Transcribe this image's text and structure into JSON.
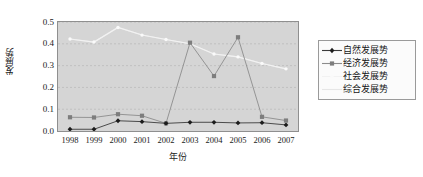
{
  "chart_data": {
    "type": "line",
    "title": "",
    "xlabel": "年份",
    "ylabel": "发展势",
    "categories": [
      "1998",
      "1999",
      "2000",
      "2001",
      "2002",
      "2003",
      "2004",
      "2005",
      "2006",
      "2007"
    ],
    "ylim": [
      0.0,
      0.5
    ],
    "yticks": [
      "0.0",
      "0.1",
      "0.2",
      "0.3",
      "0.4",
      "0.5"
    ],
    "ytick_values": [
      0.0,
      0.1,
      0.2,
      0.3,
      0.4,
      0.5
    ],
    "grid": true,
    "legend_position": "right",
    "series": [
      {
        "name": "自然发展势",
        "color": "#3b3b3b",
        "marker": "diamond",
        "marker_color": "#1c1c1c",
        "values": [
          0.008,
          0.008,
          0.047,
          0.043,
          0.035,
          0.04,
          0.04,
          0.037,
          0.038,
          0.028
        ]
      },
      {
        "name": "经济发展势",
        "color": "#8c8c8c",
        "marker": "square",
        "marker_color": "#7d7d7d",
        "values": [
          0.063,
          0.062,
          0.077,
          0.07,
          0.035,
          0.405,
          0.252,
          0.43,
          0.065,
          0.048
        ]
      },
      {
        "name": "社会发展势",
        "color": "#f2f2f2",
        "marker": "dot",
        "marker_color": "#fafafa",
        "values": [
          0.422,
          0.408,
          0.475,
          0.44,
          0.42,
          0.4,
          0.353,
          0.34,
          0.31,
          0.285
        ]
      },
      {
        "name": "综合发展势",
        "color": "#e6e6e6",
        "marker": "none",
        "marker_color": "#ededed",
        "values": [
          0.422,
          0.408,
          0.475,
          0.44,
          0.42,
          0.4,
          0.353,
          0.34,
          0.31,
          0.285
        ]
      }
    ]
  },
  "colors": {
    "plot_background": "#d5d5d5",
    "page_background": "#ffffff",
    "axis_border": "#8f8f8f",
    "gridline": "#b8b8b8",
    "legend_background": "#fbfbfb",
    "legend_border": "#9a9a9a",
    "text": "#1a1a1a"
  }
}
